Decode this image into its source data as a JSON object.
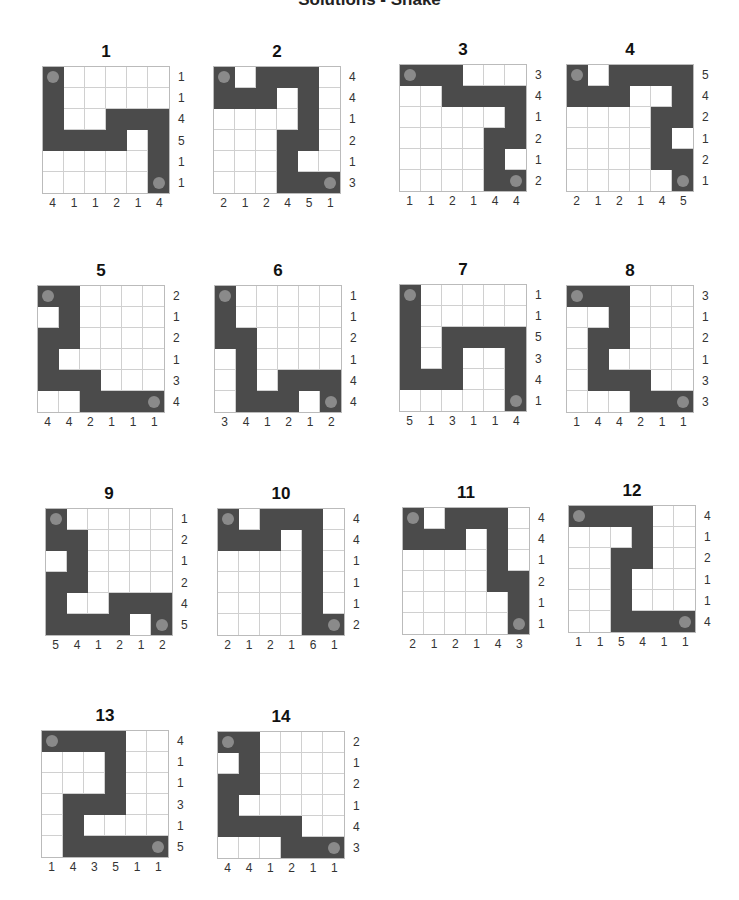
{
  "title": "Solutions - Snake",
  "colors": {
    "filled": "#4b4b4b",
    "endpoint": "#8a8a8a",
    "gridline": "#d0d0d0"
  },
  "puzzles": [
    {
      "number": "1",
      "pos": [
        42,
        42
      ],
      "grid": [
        "X.....",
        "X.....",
        "X..XXX",
        "XXXX.X",
        ".....X",
        ".....X"
      ],
      "ends": [
        [
          0,
          0
        ],
        [
          5,
          5
        ]
      ],
      "row_clues": [
        "1",
        "1",
        "4",
        "5",
        "1",
        "1"
      ],
      "col_clues": [
        "4",
        "1",
        "1",
        "2",
        "1",
        "4"
      ]
    },
    {
      "number": "2",
      "pos": [
        213,
        42
      ],
      "grid": [
        "X.XXX.",
        "XXX.X.",
        "....X.",
        "...XX.",
        "...X..",
        "...XXX"
      ],
      "ends": [
        [
          0,
          0
        ],
        [
          5,
          5
        ]
      ],
      "row_clues": [
        "4",
        "4",
        "1",
        "2",
        "1",
        "3"
      ],
      "col_clues": [
        "2",
        "1",
        "2",
        "4",
        "5",
        "1"
      ]
    },
    {
      "number": "3",
      "pos": [
        399,
        40
      ],
      "grid": [
        "XXX...",
        "..XXXX",
        ".....X",
        "....XX",
        "....X.",
        "....XX"
      ],
      "ends": [
        [
          0,
          0
        ],
        [
          5,
          5
        ]
      ],
      "row_clues": [
        "3",
        "4",
        "1",
        "2",
        "1",
        "2"
      ],
      "col_clues": [
        "1",
        "1",
        "2",
        "1",
        "4",
        "4"
      ]
    },
    {
      "number": "4",
      "pos": [
        566,
        40
      ],
      "grid": [
        "X.XXXX",
        "XXX..X",
        "....XX",
        "....X.",
        "....XX",
        ".....X"
      ],
      "ends": [
        [
          0,
          0
        ],
        [
          5,
          5
        ]
      ],
      "row_clues": [
        "5",
        "4",
        "2",
        "1",
        "2",
        "1"
      ],
      "col_clues": [
        "2",
        "1",
        "2",
        "1",
        "4",
        "5"
      ]
    },
    {
      "number": "5",
      "pos": [
        37,
        261
      ],
      "grid": [
        "XX....",
        ".X....",
        "XX....",
        "X.....",
        "XXX...",
        "..XXXX"
      ],
      "ends": [
        [
          0,
          0
        ],
        [
          5,
          5
        ]
      ],
      "row_clues": [
        "2",
        "1",
        "2",
        "1",
        "3",
        "4"
      ],
      "col_clues": [
        "4",
        "4",
        "2",
        "1",
        "1",
        "1"
      ]
    },
    {
      "number": "6",
      "pos": [
        214,
        261
      ],
      "grid": [
        "X.....",
        "X.....",
        "XX....",
        ".X....",
        ".X.XXX",
        ".XXX.X"
      ],
      "ends": [
        [
          0,
          0
        ],
        [
          5,
          5
        ]
      ],
      "row_clues": [
        "1",
        "1",
        "2",
        "1",
        "4",
        "4"
      ],
      "col_clues": [
        "3",
        "4",
        "1",
        "2",
        "1",
        "2"
      ]
    },
    {
      "number": "7",
      "pos": [
        399,
        260
      ],
      "grid": [
        "X.....",
        "X.....",
        "X.XXXX",
        "X.X..X",
        "XXX..X",
        ".....X"
      ],
      "ends": [
        [
          0,
          0
        ],
        [
          5,
          5
        ]
      ],
      "row_clues": [
        "1",
        "1",
        "5",
        "3",
        "4",
        "1"
      ],
      "col_clues": [
        "5",
        "1",
        "3",
        "1",
        "1",
        "4"
      ]
    },
    {
      "number": "8",
      "pos": [
        566,
        261
      ],
      "grid": [
        "XXX...",
        "..X...",
        ".XX...",
        ".X....",
        ".XXX..",
        "...XXX"
      ],
      "ends": [
        [
          0,
          0
        ],
        [
          5,
          5
        ]
      ],
      "row_clues": [
        "3",
        "1",
        "2",
        "1",
        "3",
        "3"
      ],
      "col_clues": [
        "1",
        "4",
        "4",
        "2",
        "1",
        "1"
      ]
    },
    {
      "number": "9",
      "pos": [
        45,
        484
      ],
      "grid": [
        "X.....",
        "XX....",
        ".X....",
        "XX....",
        "X..XXX",
        "XXXX.X"
      ],
      "ends": [
        [
          0,
          0
        ],
        [
          5,
          5
        ]
      ],
      "row_clues": [
        "1",
        "2",
        "1",
        "2",
        "4",
        "5"
      ],
      "col_clues": [
        "5",
        "4",
        "1",
        "2",
        "1",
        "2"
      ]
    },
    {
      "number": "10",
      "pos": [
        217,
        484
      ],
      "grid": [
        "X.XXX.",
        "XXX.X.",
        "....X.",
        "....X.",
        "....X.",
        "....XX"
      ],
      "ends": [
        [
          0,
          0
        ],
        [
          5,
          5
        ]
      ],
      "row_clues": [
        "4",
        "4",
        "1",
        "1",
        "1",
        "2"
      ],
      "col_clues": [
        "2",
        "1",
        "2",
        "1",
        "6",
        "1"
      ]
    },
    {
      "number": "11",
      "pos": [
        402,
        483
      ],
      "grid": [
        "X.XXX.",
        "XXX.X.",
        "....X.",
        "....XX",
        ".....X",
        ".....X"
      ],
      "ends": [
        [
          0,
          0
        ],
        [
          5,
          5
        ]
      ],
      "row_clues": [
        "4",
        "4",
        "1",
        "2",
        "1",
        "1"
      ],
      "col_clues": [
        "2",
        "1",
        "2",
        "1",
        "4",
        "3"
      ]
    },
    {
      "number": "12",
      "pos": [
        568,
        481
      ],
      "grid": [
        "XXXX..",
        "...X..",
        "..XX..",
        "..X...",
        "..X...",
        "..XXXX"
      ],
      "ends": [
        [
          0,
          0
        ],
        [
          5,
          5
        ]
      ],
      "row_clues": [
        "4",
        "1",
        "2",
        "1",
        "1",
        "4"
      ],
      "col_clues": [
        "1",
        "1",
        "5",
        "4",
        "1",
        "1"
      ]
    },
    {
      "number": "13",
      "pos": [
        41,
        706
      ],
      "grid": [
        "XXXX..",
        "...X..",
        "...X..",
        ".XXX..",
        ".X....",
        ".XXXXX"
      ],
      "ends": [
        [
          0,
          0
        ],
        [
          5,
          5
        ]
      ],
      "row_clues": [
        "4",
        "1",
        "1",
        "3",
        "1",
        "5"
      ],
      "col_clues": [
        "1",
        "4",
        "3",
        "5",
        "1",
        "1"
      ]
    },
    {
      "number": "14",
      "pos": [
        217,
        707
      ],
      "grid": [
        "XX....",
        ".X....",
        "XX....",
        "X.....",
        "XXXX..",
        "...XXX"
      ],
      "ends": [
        [
          0,
          0
        ],
        [
          5,
          5
        ]
      ],
      "row_clues": [
        "2",
        "1",
        "2",
        "1",
        "4",
        "3"
      ],
      "col_clues": [
        "4",
        "4",
        "1",
        "2",
        "1",
        "1"
      ]
    }
  ]
}
